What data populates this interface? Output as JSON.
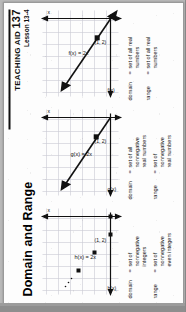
{
  "header": {
    "rule": true,
    "aid_label": "TEACHING AID",
    "aid_number": "137",
    "lesson": "Lesson 13-4"
  },
  "title": "Domain and Range",
  "colors": {
    "ink": "#111111",
    "grid": "#c9c9d4",
    "axis": "#111111",
    "paper": "#fdfdfd",
    "scan_background": "#9c9c9c"
  },
  "panels": [
    {
      "id": "panel-scatter",
      "y_axis_label": "h(x)",
      "x_axis_label": "x",
      "function_label": "h(x) = 2x",
      "point_label": "(1, 2)",
      "graph_type": "scatter",
      "points": [
        [
          0,
          0
        ],
        [
          1,
          2
        ],
        [
          2,
          4
        ],
        [
          3,
          6
        ]
      ],
      "continuation_dots": true,
      "domain": {
        "label": "domain",
        "eq": "=",
        "value": "set of\nnonnegative\nintegers"
      },
      "range": {
        "label": "range",
        "eq": "=",
        "value": "set of\nnonnegative\neven integers"
      }
    },
    {
      "id": "panel-ray",
      "y_axis_label": "g(x)",
      "x_axis_label": "x",
      "function_label": "g(x) = 2x",
      "point_label": "(1, 2)",
      "graph_type": "ray",
      "domain": {
        "label": "domain",
        "eq": "=",
        "value": "set of all\nnonnegative\nreal numbers"
      },
      "range": {
        "label": "range",
        "eq": "=",
        "value": "set of\nnonnegative\nreal numbers"
      }
    },
    {
      "id": "panel-line",
      "y_axis_label": "f(x)",
      "x_axis_label": "x",
      "function_label": "f(x) = 2x",
      "point_label": "(1, 2)",
      "graph_type": "line",
      "domain": {
        "label": "domain",
        "eq": "=",
        "value": "set of all real\nnumbers"
      },
      "range": {
        "label": "range",
        "eq": "=",
        "value": "set of all real\nnumbers"
      }
    }
  ]
}
